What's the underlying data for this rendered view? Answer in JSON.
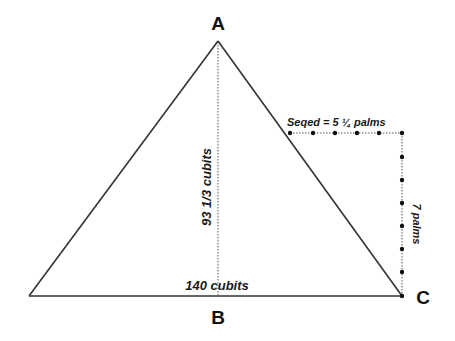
{
  "diagram": {
    "type": "pyramid-cross-section",
    "vertices": {
      "apex": "A",
      "base_mid": "B",
      "base_right": "C"
    },
    "labels": {
      "height": "93 1/3 cubits",
      "base": "140 cubits",
      "seqed": "Seqed = 5 ¼ palms",
      "rise": "7 palms"
    },
    "colors": {
      "line": "#333333",
      "dotted": "#555555",
      "text": "#111111",
      "background": "#ffffff"
    }
  }
}
